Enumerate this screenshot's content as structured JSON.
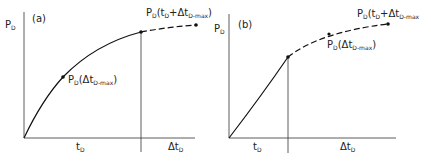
{
  "panels": [
    {
      "id": "a",
      "tag": "(a)",
      "y_label": "P",
      "y_label_sub": "D",
      "x_label_1": "t",
      "x_label_1_sub": "D",
      "x_label_2": "Δt",
      "x_label_2_sub": "D",
      "point_label_1": "P",
      "point_label_1_sub": "D",
      "point_label_1_rest": "(Δt",
      "point_label_1_sub2": "D-max",
      "point_label_1_end": ")",
      "point_label_2": "P",
      "point_label_2_sub": "D",
      "point_label_2_rest": "(t",
      "point_label_2_sub2": "D",
      "point_label_2_mid": "+Δt",
      "point_label_2_sub3": "D-max",
      "point_label_2_end": ")"
    },
    {
      "id": "b",
      "tag": "(b)",
      "y_label": "P",
      "y_label_sub": "D",
      "x_label_1": "t",
      "x_label_1_sub": "D",
      "x_label_2": "Δt",
      "x_label_2_sub": "D",
      "point_label_1": "P",
      "point_label_1_sub": "D",
      "point_label_1_rest": "(Δt",
      "point_label_1_sub2": "D-max",
      "point_label_1_end": ")",
      "point_label_2": "P",
      "point_label_2_sub": "D",
      "point_label_2_rest": "(t",
      "point_label_2_sub2": "D",
      "point_label_2_mid": "+Δt",
      "point_label_2_sub3": "D-max",
      "point_label_2_end": ""
    }
  ],
  "colors": {
    "line": "#111111",
    "background": "#ffffff"
  }
}
